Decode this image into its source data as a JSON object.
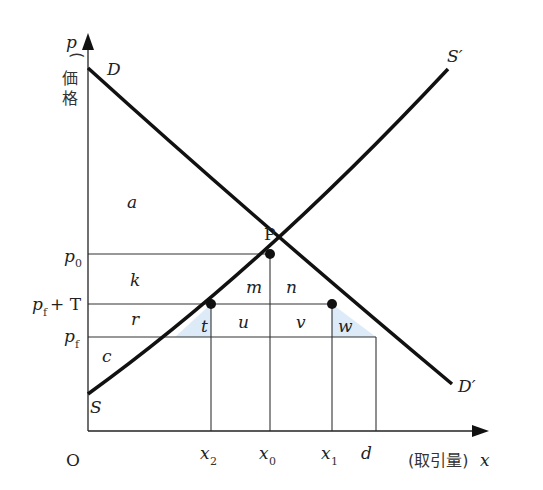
{
  "diagram": {
    "title": "",
    "axes": {
      "y_symbol": "p",
      "y_label": "価格",
      "x_symbol": "x",
      "x_label": "取引量",
      "origin": "O"
    },
    "curves": {
      "demand_start": "D",
      "demand_end": "D′",
      "supply_start": "S",
      "supply_end": "S′"
    },
    "equilibrium_point": "P",
    "price_levels": {
      "p0": {
        "base": "p",
        "sub": "0"
      },
      "pfT": {
        "base": "p",
        "sub": "f",
        "suffix": "+ T"
      },
      "pf": {
        "base": "p",
        "sub": "f"
      }
    },
    "quantity_levels": {
      "x2": {
        "base": "x",
        "sub": "2"
      },
      "x0": {
        "base": "x",
        "sub": "0"
      },
      "x1": {
        "base": "x",
        "sub": "1"
      },
      "d": {
        "base": "d"
      }
    },
    "regions": {
      "a": "a",
      "k": "k",
      "m": "m",
      "n": "n",
      "r": "r",
      "t": "t",
      "u": "u",
      "v": "v",
      "w": "w",
      "c": "c"
    },
    "colors": {
      "curve": "#111111",
      "guide": "#333333",
      "shade": "#dcebf7"
    }
  }
}
